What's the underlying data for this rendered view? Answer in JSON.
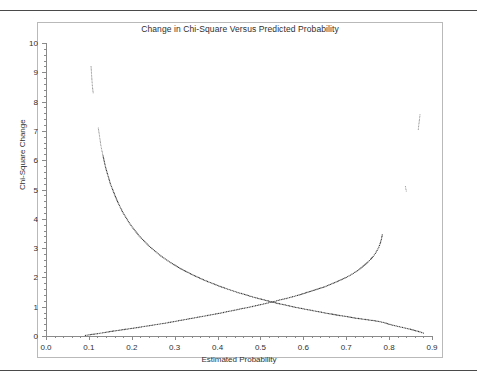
{
  "chart_title": "Change in Chi-Square Versus Predicted Probability",
  "axis": {
    "x_title": "Estimated Probability",
    "y_title": "Chi-Square Change",
    "x_ticks": [
      "0.0",
      "0.1",
      "0.2",
      "0.3",
      "0.4",
      "0.5",
      "0.6",
      "0.7",
      "0.8",
      "0.9"
    ],
    "y_ticks": [
      "0",
      "1",
      "2",
      "3",
      "4",
      "5",
      "6",
      "7",
      "8",
      "9",
      "10"
    ]
  },
  "colors": {
    "marker": "#3a3a3a",
    "marker_faint": "#8d8d8d",
    "axis": "#8a8a8a",
    "frame": "#b9b9b9",
    "rule": "#4a4a4a",
    "background": "#ffffff"
  },
  "chart_data": {
    "type": "scatter",
    "title": "Change in Chi-Square Versus Predicted Probability",
    "xlabel": "Estimated Probability",
    "ylabel": "Chi-Square Change",
    "xlim": [
      0.0,
      0.9
    ],
    "ylim": [
      0,
      10
    ],
    "grid": false,
    "legend": null,
    "series": [
      {
        "name": "Chi-square change for events (decreasing branch)",
        "marker": "dot",
        "points": [
          [
            0.105,
            9.2
          ],
          [
            0.108,
            8.55
          ],
          [
            0.11,
            8.3
          ],
          [
            0.122,
            7.1
          ],
          [
            0.124,
            6.9
          ],
          [
            0.126,
            6.7
          ],
          [
            0.128,
            6.5
          ],
          [
            0.13,
            6.35
          ],
          [
            0.133,
            6.15
          ],
          [
            0.136,
            5.95
          ],
          [
            0.139,
            5.75
          ],
          [
            0.142,
            5.6
          ],
          [
            0.146,
            5.4
          ],
          [
            0.15,
            5.2
          ],
          [
            0.154,
            5.05
          ],
          [
            0.158,
            4.9
          ],
          [
            0.163,
            4.72
          ],
          [
            0.168,
            4.55
          ],
          [
            0.173,
            4.4
          ],
          [
            0.178,
            4.25
          ],
          [
            0.184,
            4.1
          ],
          [
            0.19,
            3.96
          ],
          [
            0.196,
            3.82
          ],
          [
            0.203,
            3.68
          ],
          [
            0.21,
            3.55
          ],
          [
            0.217,
            3.42
          ],
          [
            0.225,
            3.3
          ],
          [
            0.233,
            3.18
          ],
          [
            0.241,
            3.06
          ],
          [
            0.25,
            2.95
          ],
          [
            0.259,
            2.84
          ],
          [
            0.268,
            2.73
          ],
          [
            0.278,
            2.63
          ],
          [
            0.288,
            2.53
          ],
          [
            0.298,
            2.44
          ],
          [
            0.309,
            2.34
          ],
          [
            0.32,
            2.25
          ],
          [
            0.331,
            2.17
          ],
          [
            0.343,
            2.08
          ],
          [
            0.355,
            2.0
          ],
          [
            0.367,
            1.92
          ],
          [
            0.38,
            1.84
          ],
          [
            0.393,
            1.77
          ],
          [
            0.406,
            1.69
          ],
          [
            0.42,
            1.62
          ],
          [
            0.434,
            1.55
          ],
          [
            0.448,
            1.48
          ],
          [
            0.463,
            1.42
          ],
          [
            0.478,
            1.35
          ],
          [
            0.493,
            1.29
          ],
          [
            0.509,
            1.23
          ],
          [
            0.525,
            1.17
          ],
          [
            0.541,
            1.11
          ],
          [
            0.558,
            1.06
          ],
          [
            0.575,
            1.0
          ],
          [
            0.592,
            0.95
          ],
          [
            0.61,
            0.9
          ],
          [
            0.628,
            0.85
          ],
          [
            0.646,
            0.8
          ],
          [
            0.665,
            0.75
          ],
          [
            0.684,
            0.7
          ],
          [
            0.703,
            0.66
          ],
          [
            0.722,
            0.61
          ],
          [
            0.742,
            0.57
          ],
          [
            0.762,
            0.53
          ],
          [
            0.775,
            0.5
          ],
          [
            0.79,
            0.45
          ],
          [
            0.805,
            0.38
          ],
          [
            0.82,
            0.33
          ],
          [
            0.835,
            0.28
          ],
          [
            0.85,
            0.23
          ],
          [
            0.862,
            0.18
          ],
          [
            0.872,
            0.14
          ],
          [
            0.88,
            0.1
          ]
        ]
      },
      {
        "name": "Chi-square change for non-events (increasing branch)",
        "marker": "dot",
        "points": [
          [
            0.092,
            0.02
          ],
          [
            0.1,
            0.04
          ],
          [
            0.11,
            0.06
          ],
          [
            0.12,
            0.08
          ],
          [
            0.132,
            0.11
          ],
          [
            0.145,
            0.14
          ],
          [
            0.158,
            0.17
          ],
          [
            0.172,
            0.2
          ],
          [
            0.186,
            0.23
          ],
          [
            0.2,
            0.26
          ],
          [
            0.215,
            0.29
          ],
          [
            0.23,
            0.33
          ],
          [
            0.245,
            0.36
          ],
          [
            0.26,
            0.4
          ],
          [
            0.275,
            0.43
          ],
          [
            0.29,
            0.47
          ],
          [
            0.305,
            0.51
          ],
          [
            0.32,
            0.55
          ],
          [
            0.335,
            0.59
          ],
          [
            0.35,
            0.63
          ],
          [
            0.365,
            0.67
          ],
          [
            0.38,
            0.71
          ],
          [
            0.395,
            0.75
          ],
          [
            0.41,
            0.79
          ],
          [
            0.425,
            0.84
          ],
          [
            0.44,
            0.88
          ],
          [
            0.455,
            0.93
          ],
          [
            0.47,
            0.97
          ],
          [
            0.485,
            1.02
          ],
          [
            0.5,
            1.07
          ],
          [
            0.515,
            1.12
          ],
          [
            0.53,
            1.17
          ],
          [
            0.545,
            1.23
          ],
          [
            0.56,
            1.28
          ],
          [
            0.575,
            1.34
          ],
          [
            0.59,
            1.4
          ],
          [
            0.605,
            1.47
          ],
          [
            0.62,
            1.54
          ],
          [
            0.635,
            1.61
          ],
          [
            0.65,
            1.68
          ],
          [
            0.663,
            1.76
          ],
          [
            0.676,
            1.84
          ],
          [
            0.688,
            1.92
          ],
          [
            0.7,
            2.0
          ],
          [
            0.71,
            2.08
          ],
          [
            0.72,
            2.17
          ],
          [
            0.729,
            2.26
          ],
          [
            0.737,
            2.35
          ],
          [
            0.744,
            2.44
          ],
          [
            0.751,
            2.53
          ],
          [
            0.757,
            2.62
          ],
          [
            0.763,
            2.72
          ],
          [
            0.768,
            2.82
          ],
          [
            0.772,
            2.92
          ],
          [
            0.776,
            3.03
          ],
          [
            0.779,
            3.15
          ],
          [
            0.782,
            3.3
          ],
          [
            0.784,
            3.45
          ],
          [
            0.838,
            5.1
          ],
          [
            0.84,
            4.95
          ],
          [
            0.868,
            7.05
          ],
          [
            0.872,
            7.55
          ]
        ]
      }
    ]
  }
}
